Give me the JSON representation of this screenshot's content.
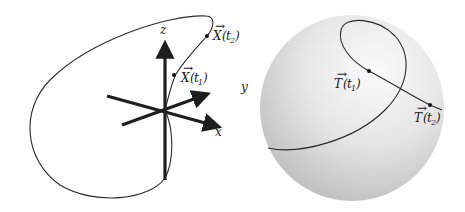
{
  "figure": {
    "left_panel": {
      "description": "Space curve X(t) with 3D coordinate axes",
      "axes": {
        "x_label": "x",
        "y_label": "y",
        "z_label": "z"
      },
      "points": [
        {
          "name": "X(t1)",
          "label_main": "X",
          "label_arg": "t",
          "label_sub": "1"
        },
        {
          "name": "X(t2)",
          "label_main": "X",
          "label_arg": "t",
          "label_sub": "2"
        }
      ]
    },
    "right_panel": {
      "description": "Tangent indicatrix T(t) on unit sphere",
      "points": [
        {
          "name": "T(t1)",
          "label_main": "T",
          "label_arg": "t",
          "label_sub": "1"
        },
        {
          "name": "T(t2)",
          "label_main": "T",
          "label_arg": "t",
          "label_sub": "2"
        }
      ]
    },
    "colors": {
      "curve": "#2a2a2a",
      "axes": "#1e1e1e",
      "sphere_light": "#f6f6f6",
      "sphere_dark": "#bdbdbd"
    }
  }
}
